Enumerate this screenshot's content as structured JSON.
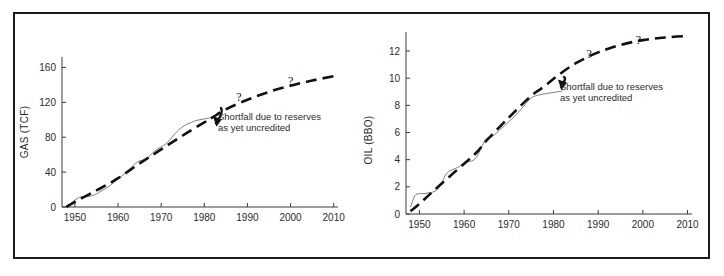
{
  "figure": {
    "width": 724,
    "height": 276,
    "background_color": "#ffffff",
    "frame_color": "#1a1a1a"
  },
  "annotation_text": {
    "line1": "Shortfall due to reserves",
    "line2": "as yet uncredited"
  },
  "question_mark": "?",
  "chart_data": [
    {
      "type": "line",
      "id": "gas",
      "title": "",
      "xlabel": "",
      "ylabel": "GAS (TCF)",
      "xlim": [
        1947,
        2011
      ],
      "ylim": [
        0,
        172
      ],
      "xticks": [
        1950,
        1960,
        1970,
        1980,
        1990,
        2000,
        2010
      ],
      "xticklabels": [
        "1950",
        "1960",
        "1970",
        "1980",
        "1990",
        "2000",
        "2010"
      ],
      "yticks": [
        0,
        40,
        80,
        120,
        160
      ],
      "yticklabels": [
        "0",
        "40",
        "80",
        "120",
        "160"
      ],
      "grid": false,
      "legend": "none",
      "annotations": [
        {
          "text_line1": "Shortfall due to reserves",
          "text_line2": "as yet uncredited",
          "points_to_x": 1982,
          "points_to_y": 104
        }
      ],
      "series": [
        {
          "name": "Cumulative discoveries (actual)",
          "style": "solid-thin",
          "color": "#6f6f6f",
          "x": [
            1948,
            1949,
            1950,
            1951,
            1952,
            1953,
            1954,
            1955,
            1956,
            1957,
            1958,
            1959,
            1960,
            1961,
            1962,
            1963,
            1964,
            1965,
            1966,
            1967,
            1968,
            1969,
            1970,
            1971,
            1972,
            1973,
            1974,
            1975,
            1976,
            1977,
            1978,
            1979,
            1980,
            1981,
            1982
          ],
          "values": [
            1,
            4,
            8,
            11,
            12,
            12,
            13,
            15,
            18,
            21,
            24,
            28,
            32,
            36,
            40,
            45,
            50,
            53,
            54,
            57,
            62,
            66,
            69,
            72,
            77,
            83,
            88,
            92,
            95,
            97,
            99,
            100,
            101,
            102,
            103
          ]
        },
        {
          "name": "Fitted / extrapolated trend",
          "style": "dashed-thick",
          "color": "#111111",
          "x": [
            1948,
            1950,
            1955,
            1960,
            1965,
            1970,
            1975,
            1980,
            1982,
            1985,
            1990,
            1995,
            2000,
            2005,
            2010
          ],
          "values": [
            0,
            6,
            19,
            33,
            50,
            66,
            82,
            97,
            103,
            112,
            123,
            132,
            139,
            145,
            150
          ]
        }
      ],
      "question_marks": [
        {
          "x": 1988,
          "y": 121
        },
        {
          "x": 2000,
          "y": 140
        }
      ]
    },
    {
      "type": "line",
      "id": "oil",
      "title": "",
      "xlabel": "",
      "ylabel": "OIL (BBO)",
      "xlim": [
        1947,
        2011
      ],
      "ylim": [
        0,
        13.4
      ],
      "xticks": [
        1950,
        1960,
        1970,
        1980,
        1990,
        2000,
        2010
      ],
      "xticklabels": [
        "1950",
        "1960",
        "1970",
        "1980",
        "1990",
        "2000",
        "2010"
      ],
      "yticks": [
        0,
        2,
        4,
        6,
        8,
        10,
        12
      ],
      "yticklabels": [
        "0",
        "2",
        "4",
        "6",
        "8",
        "10",
        "12"
      ],
      "grid": false,
      "legend": "none",
      "annotations": [
        {
          "text_line1": "Shortfall due to reserves",
          "text_line2": "as yet uncredited",
          "points_to_x": 1981,
          "points_to_y": 9.9
        }
      ],
      "series": [
        {
          "name": "Cumulative discoveries (actual)",
          "style": "solid-thin",
          "color": "#6f6f6f",
          "x": [
            1948,
            1949,
            1950,
            1951,
            1952,
            1953,
            1954,
            1955,
            1956,
            1957,
            1958,
            1959,
            1960,
            1961,
            1962,
            1963,
            1964,
            1965,
            1966,
            1967,
            1968,
            1969,
            1970,
            1971,
            1972,
            1973,
            1974,
            1975,
            1976,
            1977,
            1978,
            1979,
            1980,
            1981,
            1982
          ],
          "values": [
            0.5,
            1.35,
            1.5,
            1.5,
            1.55,
            1.62,
            1.8,
            2.3,
            2.95,
            3.2,
            3.35,
            3.5,
            3.75,
            3.85,
            3.95,
            4.3,
            5.0,
            5.55,
            5.65,
            5.9,
            6.2,
            6.5,
            6.8,
            7.1,
            7.45,
            7.8,
            8.2,
            8.55,
            8.7,
            8.78,
            8.85,
            8.9,
            8.95,
            9.0,
            9.05
          ]
        },
        {
          "name": "Fitted / extrapolated trend",
          "style": "dashed-thick",
          "color": "#111111",
          "x": [
            1948,
            1950,
            1952,
            1955,
            1960,
            1963,
            1965,
            1970,
            1975,
            1978,
            1981,
            1985,
            1990,
            1995,
            2000,
            2005,
            2010
          ],
          "values": [
            0.2,
            0.75,
            1.35,
            2.25,
            3.7,
            4.6,
            5.4,
            7.1,
            8.7,
            9.4,
            10.2,
            11.1,
            11.9,
            12.45,
            12.8,
            13.0,
            13.1
          ]
        }
      ],
      "question_marks": [
        {
          "x": 1988,
          "y": 11.5
        },
        {
          "x": 1999,
          "y": 12.5
        }
      ]
    }
  ]
}
